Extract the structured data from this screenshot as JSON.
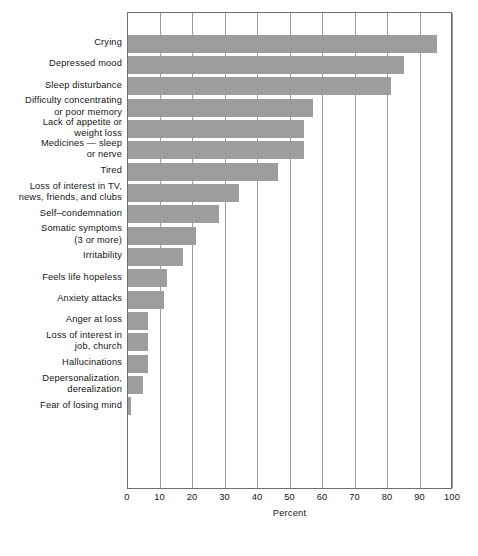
{
  "chart_data": {
    "type": "bar",
    "orientation": "horizontal",
    "title": "",
    "subtitle": "",
    "xlabel": "Percent",
    "ylabel": "",
    "xlim": [
      0,
      100
    ],
    "xticks": [
      0,
      10,
      20,
      30,
      40,
      50,
      60,
      70,
      80,
      90,
      100
    ],
    "xtick_labels": [
      "0",
      "10",
      "20",
      "30",
      "40",
      "50",
      "60",
      "70",
      "80",
      "90",
      "100"
    ],
    "grid": true,
    "legend": null,
    "bar_color": "#9d9d9d",
    "axis_color": "#6f6f6f",
    "gridline_color": "#9a9a9a",
    "categories": [
      "Crying",
      "Depressed mood",
      "Sleep disturbance",
      "Difficulty concentrating\nor poor memory",
      "Lack of appetite or\nweight loss",
      "Medicines — sleep\nor nerve",
      "Tired",
      "Loss of interest in TV,\nnews, friends, and clubs",
      "Self–condemnation",
      "Somatic symptoms\n(3 or more)",
      "Irritability",
      "Feels life hopeless",
      "Anxiety attacks",
      "Anger at loss",
      "Loss of interest in\njob, church",
      "Hallucinations",
      "Depersonalization,\nderealization",
      "Fear of losing mind"
    ],
    "values": [
      95,
      85,
      81,
      57,
      54,
      54,
      46,
      34,
      28,
      21,
      17,
      12,
      11,
      6,
      6,
      6,
      4.5,
      1
    ]
  }
}
